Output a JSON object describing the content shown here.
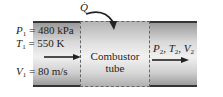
{
  "diagram": {
    "heat_input": {
      "symbol": "Q",
      "accent": "dot"
    },
    "inlet": {
      "pressure": {
        "var": "P",
        "sub": "1",
        "value": "= 480 kPa"
      },
      "temperature": {
        "var": "T",
        "sub": "1",
        "value": "= 550 K"
      },
      "velocity": {
        "var": "V",
        "sub": "1",
        "value": "= 80 m/s"
      }
    },
    "combustor": {
      "line1": "Combustor",
      "line2": "tube"
    },
    "outlet": {
      "p": {
        "var": "P",
        "sub": "2"
      },
      "t": {
        "var": "T",
        "sub": "2"
      },
      "v": {
        "var": "V",
        "sub": "2"
      },
      "sep": ","
    },
    "colors": {
      "line": "#333333",
      "tube_edge": "#9a9a9a",
      "tube_center": "#f0f0f0"
    }
  }
}
